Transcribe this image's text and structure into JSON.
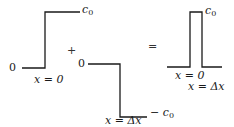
{
  "diagram": {
    "panels": [
      {
        "id": "positive-step",
        "left_level": "0",
        "right_level": "c",
        "right_level_sub": "0",
        "step_location": "x = 0"
      },
      {
        "id": "negative-step",
        "left_level": "0",
        "right_level": "− c",
        "right_level_sub": "0",
        "step_location": "x = Δx"
      },
      {
        "id": "pulse",
        "top_level": "c",
        "top_level_sub": "0",
        "left_edge": "x = 0",
        "right_edge": "x = Δx"
      }
    ],
    "operators": {
      "plus": "+",
      "equals": "="
    },
    "colors": {
      "line": "#1a1a1a",
      "background": "#ffffff"
    }
  }
}
